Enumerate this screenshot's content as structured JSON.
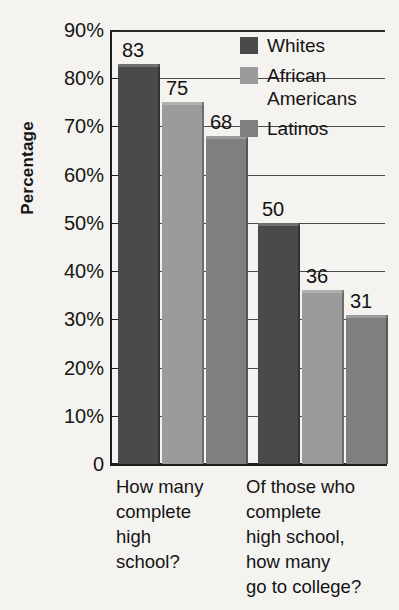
{
  "chart_data": {
    "type": "bar",
    "title": "",
    "subtitle": "",
    "xlabel": "",
    "ylabel": "Percentage",
    "ylim": [
      0,
      90
    ],
    "grid": true,
    "legend_position": "top-right",
    "categories": [
      "How many\ncomplete\nhigh\nschool?",
      "Of those who\ncomplete\nhigh school,\nhow many\ngo to college?"
    ],
    "series": [
      {
        "name": "Whites",
        "values": [
          83,
          50
        ],
        "color": "#4a4a4a"
      },
      {
        "name": "African\nAmericans",
        "values": [
          75,
          36
        ],
        "color": "#9b9b9b"
      },
      {
        "name": "Latinos",
        "values": [
          68,
          31
        ],
        "color": "#7f7f7f"
      }
    ],
    "y_ticks": [
      {
        "value": 90,
        "label": "90%"
      },
      {
        "value": 80,
        "label": "80%"
      },
      {
        "value": 70,
        "label": "70%"
      },
      {
        "value": 60,
        "label": "60%"
      },
      {
        "value": 50,
        "label": "50%"
      },
      {
        "value": 40,
        "label": "40%"
      },
      {
        "value": 30,
        "label": "30%"
      },
      {
        "value": 20,
        "label": "20%"
      },
      {
        "value": 10,
        "label": "10%"
      },
      {
        "value": 0,
        "label": "0"
      }
    ],
    "data_labels": [
      {
        "group": 0,
        "series": 0,
        "text": "83"
      },
      {
        "group": 0,
        "series": 1,
        "text": "75"
      },
      {
        "group": 0,
        "series": 2,
        "text": "68"
      },
      {
        "group": 1,
        "series": 0,
        "text": "50"
      },
      {
        "group": 1,
        "series": 1,
        "text": "36"
      },
      {
        "group": 1,
        "series": 2,
        "text": "31"
      }
    ]
  },
  "colors": {
    "background": "#f4f3f0",
    "axis": "#1d1d1d",
    "grid": "#2a2a2a",
    "text": "#141414"
  }
}
